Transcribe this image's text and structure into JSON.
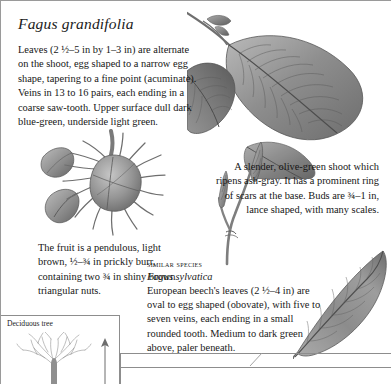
{
  "page": {
    "species_title": "Fagus grandifolia",
    "description": "Leaves (2 ½–5 in by 1–3 in) are alternate on the shoot, egg shaped to a narrow egg shape, tapering to a fine point (acuminate). Veins in 13 to 16 pairs, each ending in a coarse saw-tooth. Upper surface dull dark blue-green, underside light green.",
    "fruit_caption": "The fruit is a pendulous, light brown, ½–¾ in prickly burr, containing two ¾ in shiny brown triangular nuts.",
    "shoot_caption": "A slender, olive-green shoot which ripens ash-gray. It has a prominent ring of scars at the base. Buds are ¾–1 in, lance shaped, with many scales."
  },
  "similar_species": {
    "heading": "Similar species",
    "latin_name": "Fagus sylvatica",
    "description": "European beech's leaves (2 ½–4 in) are oval to egg shaped (obovate), with five to seven veins, each ending in a small rounded tooth. Medium to dark green above, paler beneath."
  },
  "habit": {
    "label": "Deciduous tree",
    "tree_icon": "deciduous-tree-silhouette",
    "scale_icon": "height-scale-arrow"
  },
  "illustrations": [
    {
      "name": "beech-leaf-spray",
      "caption_ref": "description"
    },
    {
      "name": "beech-burr-and-nuts",
      "caption_ref": "fruit_caption"
    },
    {
      "name": "beech-twig-with-buds",
      "caption_ref": "shoot_caption"
    },
    {
      "name": "european-beech-leaf",
      "caption_ref": "similar_species.description"
    }
  ],
  "colors": {
    "page_background": "#ffffff",
    "text": "#161616",
    "rule": "#8d8d8d",
    "illustration_gray": "#7f7f7f"
  }
}
